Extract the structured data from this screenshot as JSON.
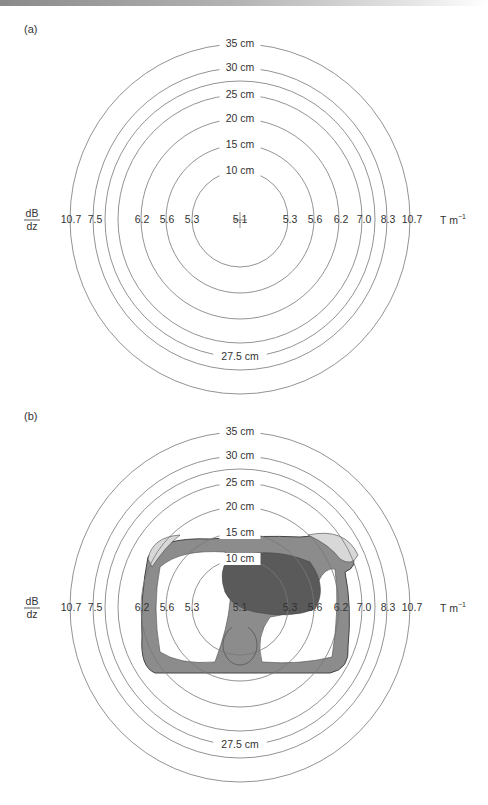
{
  "figure": {
    "panels": [
      {
        "id": "a",
        "label": "(a)",
        "label_pos": [
          24,
          33
        ],
        "center": [
          240,
          219
        ],
        "show_chest": false
      },
      {
        "id": "b",
        "label": "(b)",
        "label_pos": [
          24,
          420
        ],
        "center": [
          240,
          607
        ],
        "show_chest": true
      }
    ],
    "rings": [
      {
        "label": "10 cm",
        "rx": 48,
        "ry": 48,
        "label_at": "top"
      },
      {
        "label": "15 cm",
        "rx": 74,
        "ry": 74,
        "label_at": "top"
      },
      {
        "label": "20 cm",
        "rx": 99,
        "ry": 100,
        "label_at": "top"
      },
      {
        "label": "25 cm",
        "rx": 122,
        "ry": 124,
        "label_at": "top"
      },
      {
        "label": "27.5 cm",
        "rx": 135,
        "ry": 138,
        "label_at": "bottom"
      },
      {
        "label": "30 cm",
        "rx": 147,
        "ry": 151,
        "label_at": "top"
      },
      {
        "label": "35 cm",
        "rx": 170,
        "ry": 175,
        "label_at": "top"
      }
    ],
    "gradient_axis": {
      "quantity_numerator": "dB",
      "quantity_denominator": "dz",
      "unit": "T m",
      "unit_exponent": "−1",
      "left_values": [
        {
          "v": "10.7",
          "x": 71
        },
        {
          "v": "7.5",
          "x": 95
        },
        {
          "v": "6.2",
          "x": 142
        },
        {
          "v": "5.6",
          "x": 167
        },
        {
          "v": "5.3",
          "x": 192
        }
      ],
      "center_value": {
        "v": "5.1",
        "x": 240
      },
      "right_values": [
        {
          "v": "5.3",
          "x": 290
        },
        {
          "v": "5.6",
          "x": 315
        },
        {
          "v": "6.2",
          "x": 341
        },
        {
          "v": "7.0",
          "x": 364
        },
        {
          "v": "8.3",
          "x": 388
        },
        {
          "v": "10.7",
          "x": 412
        }
      ]
    },
    "chest_image": {
      "description": "axial chest cross-section with heart, ribs and spine",
      "colors": {
        "tissue_dark": "#5a5a5a",
        "tissue_mid": "#8c8c8c",
        "bone_light": "#d8d8d8",
        "outline": "#444444"
      }
    }
  }
}
